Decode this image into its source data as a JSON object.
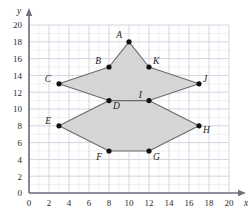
{
  "chart_data": {
    "type": "scatter",
    "title": "",
    "xlabel": "x",
    "ylabel": "y",
    "xlim": [
      0,
      20
    ],
    "ylim": [
      0,
      20
    ],
    "xticks": [
      0,
      2,
      4,
      6,
      8,
      10,
      12,
      14,
      16,
      18,
      20
    ],
    "yticks": [
      0,
      2,
      4,
      6,
      8,
      10,
      12,
      14,
      16,
      18,
      20
    ],
    "xtick_labels": [
      "0",
      "2",
      "4",
      "6",
      "8",
      "10",
      "12",
      "14",
      "16",
      "18",
      "20"
    ],
    "ytick_labels": [
      "0",
      "2",
      "4",
      "6",
      "8",
      "10",
      "12",
      "14",
      "16",
      "18",
      "20"
    ],
    "grid": true,
    "grid_minor_step": 1,
    "grid_major_step": 2,
    "legend": "none",
    "points": [
      {
        "label": "A",
        "x": 10,
        "y": 18,
        "label_dx": -7,
        "label_dy": -4
      },
      {
        "label": "B",
        "x": 8,
        "y": 15,
        "label_dx": -8,
        "label_dy": -3
      },
      {
        "label": "C",
        "x": 3,
        "y": 13,
        "label_dx": -8,
        "label_dy": -2
      },
      {
        "label": "D",
        "x": 8,
        "y": 11,
        "label_dx": 4,
        "label_dy": 8
      },
      {
        "label": "E",
        "x": 3,
        "y": 8,
        "label_dx": -8,
        "label_dy": -2
      },
      {
        "label": "F",
        "x": 8,
        "y": 5,
        "label_dx": -7,
        "label_dy": 9
      },
      {
        "label": "G",
        "x": 12,
        "y": 5,
        "label_dx": 4,
        "label_dy": 9
      },
      {
        "label": "H",
        "x": 17,
        "y": 8,
        "label_dx": 4,
        "label_dy": 7
      },
      {
        "label": "I",
        "x": 12,
        "y": 11,
        "label_dx": -7,
        "label_dy": -3
      },
      {
        "label": "J",
        "x": 17,
        "y": 13,
        "label_dx": 4,
        "label_dy": -2
      },
      {
        "label": "K",
        "x": 12,
        "y": 15,
        "label_dx": 4,
        "label_dy": -3
      }
    ],
    "polygons": [
      {
        "name": "upper-polygon",
        "vertices": [
          "A",
          "K",
          "J",
          "I",
          "D",
          "C",
          "B"
        ],
        "points_xy": [
          [
            10,
            18
          ],
          [
            12,
            15
          ],
          [
            17,
            13
          ],
          [
            12,
            11
          ],
          [
            8,
            11
          ],
          [
            3,
            13
          ],
          [
            8,
            15
          ]
        ],
        "fill": "#d4d4d4",
        "stroke": "#6b6b6b"
      },
      {
        "name": "lower-polygon",
        "vertices": [
          "D",
          "I",
          "H",
          "G",
          "F",
          "E"
        ],
        "points_xy": [
          [
            8,
            11
          ],
          [
            12,
            11
          ],
          [
            17,
            8
          ],
          [
            12,
            5
          ],
          [
            8,
            5
          ],
          [
            3,
            8
          ]
        ],
        "fill": "#d4d4d4",
        "stroke": "#6b6b6b"
      }
    ],
    "colors": {
      "fill": "#d4d4d4",
      "stroke": "#6b6b6b",
      "point": "#111111",
      "axis": "#6f6f80",
      "grid_minor": "#dfe1ea",
      "grid_major": "#c9cdd9",
      "text": "#1c1c1c"
    }
  }
}
